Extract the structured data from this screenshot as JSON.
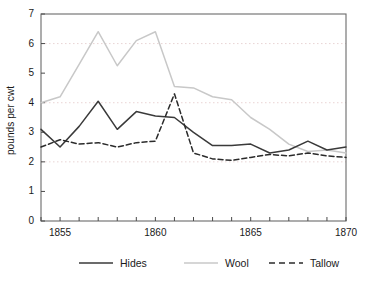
{
  "chart_data": {
    "type": "line",
    "title": "",
    "xlabel": "",
    "ylabel": "pounds per cwt",
    "xlim": [
      1854,
      1870
    ],
    "ylim": [
      0,
      7
    ],
    "grid": "horizontal dotted gridlines at 2, 4, 6",
    "legend_position": "below-plot",
    "x": [
      1854,
      1855,
      1856,
      1857,
      1858,
      1859,
      1860,
      1861,
      1862,
      1863,
      1864,
      1865,
      1866,
      1867,
      1868,
      1869,
      1870
    ],
    "xticks": [
      1854,
      1855,
      1856,
      1857,
      1858,
      1859,
      1860,
      1861,
      1862,
      1863,
      1864,
      1865,
      1866,
      1867,
      1868,
      1869,
      1870
    ],
    "xtick_labels": [
      "",
      "1855",
      "",
      "",
      "",
      "",
      "1860",
      "",
      "",
      "",
      "",
      "1865",
      "",
      "",
      "",
      "",
      "1870"
    ],
    "yticks": [
      0,
      1,
      2,
      3,
      4,
      5,
      6,
      7
    ],
    "ytick_labels": [
      "0",
      "1",
      "2",
      "3",
      "4",
      "5",
      "6",
      "7"
    ],
    "series": [
      {
        "name": "Hides",
        "style": "solid",
        "color": "#3a3a3a",
        "values": [
          3.1,
          2.5,
          3.2,
          4.05,
          3.1,
          3.7,
          3.55,
          3.5,
          3.0,
          2.55,
          2.55,
          2.6,
          2.3,
          2.4,
          2.7,
          2.4,
          2.5
        ]
      },
      {
        "name": "Wool",
        "style": "solid",
        "color": "#c8c8c8",
        "values": [
          4.0,
          4.2,
          5.3,
          6.4,
          5.25,
          6.1,
          6.4,
          4.55,
          4.5,
          4.2,
          4.1,
          3.5,
          3.1,
          2.6,
          2.35,
          2.4,
          2.3
        ]
      },
      {
        "name": "Tallow",
        "style": "dashed",
        "color": "#2b2b2b",
        "values": [
          2.5,
          2.75,
          2.6,
          2.65,
          2.5,
          2.65,
          2.7,
          4.3,
          2.3,
          2.1,
          2.05,
          2.15,
          2.25,
          2.2,
          2.3,
          2.2,
          2.15
        ]
      }
    ]
  },
  "legend": {
    "items": [
      {
        "label": "Hides"
      },
      {
        "label": "Wool"
      },
      {
        "label": "Tallow"
      }
    ]
  },
  "axes": {
    "y_axis_title": "pounds per cwt"
  }
}
